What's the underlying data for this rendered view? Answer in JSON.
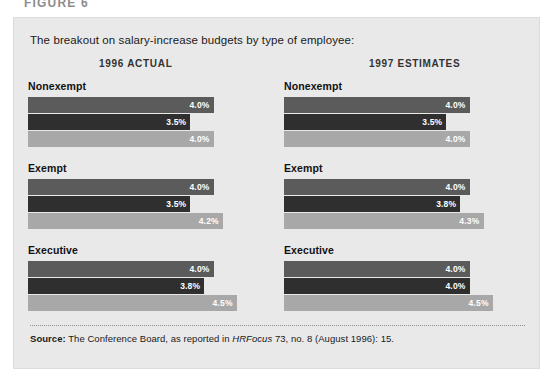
{
  "figure_heading": "FIGURE 6",
  "panel": {
    "intro": "The breakout on salary-increase budgets by type of employee:",
    "column_headers": {
      "left": "1996 ACTUAL",
      "right": "1997 ESTIMATES"
    }
  },
  "source": {
    "label": "Source:",
    "text_before_italic": " The Conference Board, as reported in ",
    "italic": "HRFocus",
    "text_after_italic": " 73, no. 8 (August 1996): 15."
  },
  "colors": {
    "panel_background": "#e9e9e9",
    "page_background": "#ffffff",
    "bar_mid": "#5b5b5b",
    "bar_dark": "#2f2f2f",
    "bar_light": "#a8a8a8",
    "label_text": "#ffffff"
  },
  "chart_data": {
    "type": "bar",
    "title": "The breakout on salary-increase budgets by type of employee:",
    "orientation": "horizontal",
    "xlabel": "",
    "ylabel": "",
    "xlim": [
      0,
      5.0
    ],
    "grid": false,
    "legend": "none",
    "value_suffix": "%",
    "categories": [
      "Nonexempt",
      "Exempt",
      "Executive"
    ],
    "panels": [
      {
        "name": "1996 ACTUAL",
        "groups": [
          {
            "category": "Nonexempt",
            "bars": [
              {
                "value": 4.0,
                "label": "4.0%",
                "shade": "mid"
              },
              {
                "value": 3.5,
                "label": "3.5%",
                "shade": "dark"
              },
              {
                "value": 4.0,
                "label": "4.0%",
                "shade": "light"
              }
            ]
          },
          {
            "category": "Exempt",
            "bars": [
              {
                "value": 4.0,
                "label": "4.0%",
                "shade": "mid"
              },
              {
                "value": 3.5,
                "label": "3.5%",
                "shade": "dark"
              },
              {
                "value": 4.2,
                "label": "4.2%",
                "shade": "light"
              }
            ]
          },
          {
            "category": "Executive",
            "bars": [
              {
                "value": 4.0,
                "label": "4.0%",
                "shade": "mid"
              },
              {
                "value": 3.8,
                "label": "3.8%",
                "shade": "dark"
              },
              {
                "value": 4.5,
                "label": "4.5%",
                "shade": "light"
              }
            ]
          }
        ]
      },
      {
        "name": "1997 ESTIMATES",
        "groups": [
          {
            "category": "Nonexempt",
            "bars": [
              {
                "value": 4.0,
                "label": "4.0%",
                "shade": "mid"
              },
              {
                "value": 3.5,
                "label": "3.5%",
                "shade": "dark"
              },
              {
                "value": 4.0,
                "label": "4.0%",
                "shade": "light"
              }
            ]
          },
          {
            "category": "Exempt",
            "bars": [
              {
                "value": 4.0,
                "label": "4.0%",
                "shade": "mid"
              },
              {
                "value": 3.8,
                "label": "3.8%",
                "shade": "dark"
              },
              {
                "value": 4.3,
                "label": "4.3%",
                "shade": "light"
              }
            ]
          },
          {
            "category": "Executive",
            "bars": [
              {
                "value": 4.0,
                "label": "4.0%",
                "shade": "mid"
              },
              {
                "value": 4.0,
                "label": "4.0%",
                "shade": "dark"
              },
              {
                "value": 4.5,
                "label": "4.5%",
                "shade": "light"
              }
            ]
          }
        ]
      }
    ]
  }
}
